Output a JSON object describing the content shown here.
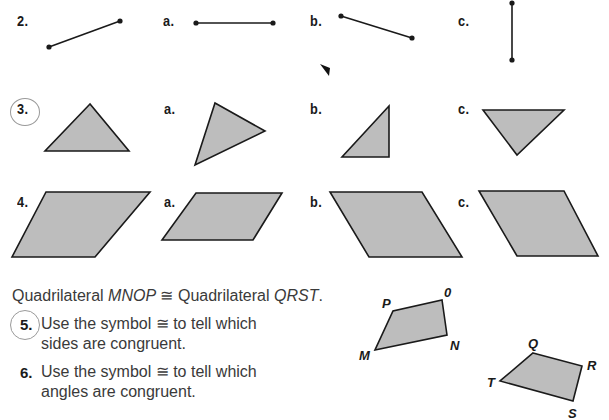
{
  "exercise_2": {
    "label": "2.",
    "options": [
      "a.",
      "b.",
      "c."
    ],
    "figure_type": "line-segment"
  },
  "exercise_3": {
    "label": "3.",
    "options": [
      "a.",
      "b.",
      "c."
    ],
    "figure_type": "triangle",
    "circled": true
  },
  "exercise_4": {
    "label": "4.",
    "options": [
      "a.",
      "b.",
      "c."
    ],
    "figure_type": "parallelogram"
  },
  "statement": {
    "prefix": "Quadrilateral ",
    "first": "MNOP",
    "symbol": " ≅ ",
    "middle": "Quadrilateral ",
    "second": "QRST",
    "suffix": "."
  },
  "questions": [
    {
      "number": "5.",
      "line1": "Use the symbol ≅ to tell which",
      "line2": "sides are congruent.",
      "circled": true
    },
    {
      "number": "6.",
      "line1": "Use the symbol ≅ to tell which",
      "line2": "angles are congruent.",
      "circled": false
    }
  ],
  "quad_mnop": {
    "vertices": [
      "M",
      "N",
      "O",
      "P"
    ],
    "labels": {
      "M": "M",
      "N": "N",
      "O": "0",
      "P": "P"
    }
  },
  "quad_qrst": {
    "vertices": [
      "Q",
      "R",
      "S",
      "T"
    ],
    "labels": {
      "Q": "Q",
      "R": "R",
      "S": "S",
      "T": "T"
    }
  },
  "colors": {
    "shape_fill": "#bdbdbd",
    "ink": "#1a1a1a",
    "body_text": "#3a3a3a"
  }
}
